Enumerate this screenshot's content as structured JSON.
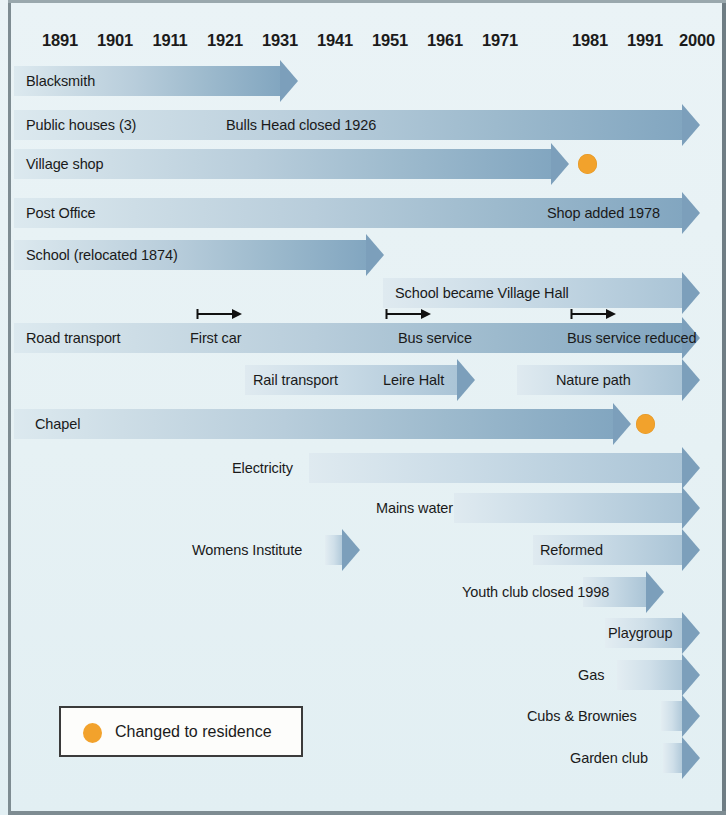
{
  "colors": {
    "background": "#e8f2f5",
    "bar_light": "#dce9ef",
    "bar_dark": "#82a6c0",
    "residence_dot": "#f2a22c",
    "frame": "#7e8c92",
    "text": "#1a1a1a"
  },
  "axis": {
    "label": "Year",
    "years": [
      "1891",
      "1901",
      "1911",
      "1921",
      "1931",
      "1941",
      "1951",
      "1961",
      "1971",
      "1981",
      "1991",
      "2000"
    ],
    "positions": [
      60,
      115,
      170,
      225,
      280,
      335,
      390,
      445,
      500,
      590,
      645,
      697
    ]
  },
  "legend": {
    "marker_name": "orange-dot",
    "text": "Changed to residence"
  },
  "chart_data": {
    "type": "timeline",
    "xlabel": "Year",
    "ylabel": "",
    "xlim": [
      1891,
      2000
    ],
    "grid": false,
    "legend_position": "bottom-left",
    "legend_entries": [
      {
        "marker": "orange-dot",
        "label": "Changed to residence"
      }
    ],
    "rows": [
      {
        "name": "Blacksmith",
        "bars": [
          {
            "label": "Blacksmith",
            "label_align": "left",
            "start_year": 1891,
            "end_year": 1931
          }
        ],
        "markers": [],
        "dots": []
      },
      {
        "name": "Public houses (3)",
        "bars": [
          {
            "label": "Public houses (3)",
            "label_align": "left",
            "start_year": 1891,
            "end_year": 2000
          }
        ],
        "annotations": [
          {
            "text": "Bulls Head closed 1926",
            "year": 1921
          }
        ],
        "markers": [],
        "dots": []
      },
      {
        "name": "Village shop",
        "bars": [
          {
            "label": "Village shop",
            "label_align": "left",
            "start_year": 1891,
            "end_year": 1982
          }
        ],
        "markers": [],
        "dots": [
          {
            "year": 1984,
            "label": "Changed to residence"
          }
        ]
      },
      {
        "name": "Post Office",
        "bars": [
          {
            "label": "Post Office",
            "label_align": "left",
            "start_year": 1891,
            "end_year": 2000
          }
        ],
        "annotations": [
          {
            "text": "Shop added 1978",
            "year": 1978
          }
        ],
        "markers": [],
        "dots": []
      },
      {
        "name": "School (relocated 1874)",
        "bars": [
          {
            "label": "School (relocated 1874)",
            "label_align": "left",
            "start_year": 1891,
            "end_year": 1949
          }
        ],
        "markers": [],
        "dots": []
      },
      {
        "name": "School became Village Hall",
        "bars": [
          {
            "label": "School became Village Hall",
            "label_align": "left",
            "start_year": 1949,
            "end_year": 2000
          }
        ],
        "markers": [],
        "dots": []
      },
      {
        "name": "Road transport",
        "bars": [
          {
            "label": "Road transport",
            "label_align": "left",
            "start_year": 1891,
            "end_year": 2000
          }
        ],
        "annotations": [
          {
            "text": "First car",
            "year": 1918
          },
          {
            "text": "Bus service",
            "year": 1950
          },
          {
            "text": "Bus service reduced",
            "year": 1978
          }
        ],
        "markers": [
          {
            "label": "First car",
            "year": 1915
          },
          {
            "label": "Bus service",
            "year": 1949
          },
          {
            "label": "Bus service reduced",
            "year": 1977
          }
        ],
        "dots": []
      },
      {
        "name": "Rail transport",
        "bars": [
          {
            "label": "Rail transport  Leire Halt",
            "label_align": "left",
            "start_year": 1933,
            "end_year": 1962
          },
          {
            "label": "Nature path",
            "label_align": "left",
            "start_year": 1971,
            "end_year": 2000
          }
        ],
        "markers": [],
        "dots": []
      },
      {
        "name": "Chapel",
        "bars": [
          {
            "label": "Chapel",
            "label_align": "left",
            "start_year": 1891,
            "end_year": 1982
          }
        ],
        "markers": [],
        "dots": [
          {
            "year": 1986,
            "label": "Changed to residence"
          }
        ]
      },
      {
        "name": "Electricity",
        "bars": [
          {
            "label": "Electricity",
            "label_align": "left",
            "start_year": 1937,
            "end_year": 2000
          }
        ],
        "markers": [],
        "dots": []
      },
      {
        "name": "Mains water",
        "bars": [
          {
            "label": "Mains water",
            "label_align": "left",
            "start_year": 1952,
            "end_year": 2000
          }
        ],
        "markers": [],
        "dots": []
      },
      {
        "name": "Womens Institute",
        "bars": [
          {
            "label": "Womens Institute",
            "label_align": "left",
            "start_year": 1924,
            "end_year": 1944
          },
          {
            "label": "Reformed",
            "label_align": "left",
            "start_year": 1965,
            "end_year": 2000
          }
        ],
        "markers": [],
        "dots": []
      },
      {
        "name": "Youth club",
        "bars": [
          {
            "label": "Youth club  closed 1998",
            "label_align": "left",
            "start_year": 1955,
            "end_year": 1993
          }
        ],
        "markers": [],
        "dots": []
      },
      {
        "name": "Playgroup",
        "bars": [
          {
            "label": "Playgroup",
            "label_align": "left",
            "start_year": 1981,
            "end_year": 2000
          }
        ],
        "markers": [],
        "dots": []
      },
      {
        "name": "Gas",
        "bars": [
          {
            "label": "Gas",
            "label_align": "left",
            "start_year": 1983,
            "end_year": 2000
          }
        ],
        "markers": [],
        "dots": []
      },
      {
        "name": "Cubs & Brownies",
        "bars": [
          {
            "label": "Cubs & Brownies",
            "label_align": "left",
            "start_year": 1991,
            "end_year": 2000
          }
        ],
        "markers": [],
        "dots": []
      },
      {
        "name": "Garden club",
        "bars": [
          {
            "label": "Garden club",
            "label_align": "left",
            "start_year": 1993,
            "end_year": 2000
          }
        ],
        "markers": [],
        "dots": []
      }
    ]
  },
  "layout": {
    "rows": [
      {
        "top": 66,
        "bars": [
          {
            "x": 14,
            "w": 284,
            "cls": "",
            "labels": [
              {
                "text": "Blacksmith",
                "x": 26,
                "align": "left"
              }
            ]
          }
        ],
        "markers": [],
        "dots": []
      },
      {
        "top": 110,
        "bars": [
          {
            "x": 14,
            "w": 686,
            "cls": "",
            "labels": [
              {
                "text": "Public houses (3)",
                "x": 26,
                "align": "left"
              },
              {
                "text": "Bulls Head closed 1926",
                "x": 226,
                "align": "left"
              }
            ]
          }
        ],
        "markers": [],
        "dots": []
      },
      {
        "top": 149,
        "bars": [
          {
            "x": 14,
            "w": 555,
            "cls": "",
            "labels": [
              {
                "text": "Village shop",
                "x": 26,
                "align": "left"
              }
            ]
          }
        ],
        "markers": [],
        "dots": [
          {
            "x": 578,
            "y": 5
          }
        ]
      },
      {
        "top": 198,
        "bars": [
          {
            "x": 14,
            "w": 686,
            "cls": "",
            "labels": [
              {
                "text": "Post Office",
                "x": 26,
                "align": "left"
              },
              {
                "text": "Shop added 1978",
                "x": 660,
                "align": "right"
              }
            ]
          }
        ],
        "markers": [],
        "dots": []
      },
      {
        "top": 240,
        "bars": [
          {
            "x": 14,
            "w": 370,
            "cls": "",
            "labels": [
              {
                "text": "School (relocated 1874)",
                "x": 26,
                "align": "left"
              }
            ]
          }
        ],
        "markers": [],
        "dots": []
      },
      {
        "top": 278,
        "bars": [
          {
            "x": 383,
            "w": 317,
            "cls": "short",
            "labels": [
              {
                "text": "School became Village Hall",
                "x": 395,
                "align": "left"
              }
            ]
          }
        ],
        "markers": [],
        "dots": []
      },
      {
        "top": 323,
        "bars": [
          {
            "x": 14,
            "w": 686,
            "cls": "",
            "labels": [
              {
                "text": "Road transport",
                "x": 26,
                "align": "left"
              },
              {
                "text": "First car",
                "x": 190,
                "align": "left"
              },
              {
                "text": "Bus service",
                "x": 398,
                "align": "left"
              },
              {
                "text": "Bus service reduced",
                "x": 567,
                "align": "left"
              }
            ]
          }
        ],
        "markers": [
          {
            "x": 196,
            "y": -16,
            "w": 46
          },
          {
            "x": 385,
            "y": -16,
            "w": 46
          },
          {
            "x": 570,
            "y": -16,
            "w": 46
          }
        ],
        "dots": []
      },
      {
        "top": 365,
        "bars": [
          {
            "x": 245,
            "w": 230,
            "cls": "short",
            "labels": [
              {
                "text": "Rail transport",
                "x": 253,
                "align": "left"
              },
              {
                "text": "Leire Halt",
                "x": 383,
                "align": "left"
              }
            ]
          },
          {
            "x": 517,
            "w": 183,
            "cls": "short",
            "labels": [
              {
                "text": "Nature path",
                "x": 556,
                "align": "left"
              }
            ]
          }
        ],
        "markers": [],
        "dots": []
      },
      {
        "top": 409,
        "bars": [
          {
            "x": 14,
            "w": 617,
            "cls": "",
            "labels": [
              {
                "text": "Chapel",
                "x": 35,
                "align": "left"
              }
            ]
          }
        ],
        "markers": [],
        "dots": [
          {
            "x": 636,
            "y": 5
          }
        ]
      },
      {
        "top": 453,
        "bars": [
          {
            "x": 309,
            "w": 391,
            "cls": "short",
            "labels": [
              {
                "text": "Electricity",
                "x": 232,
                "align": "left"
              }
            ]
          }
        ],
        "markers": [],
        "dots": []
      },
      {
        "top": 493,
        "bars": [
          {
            "x": 454,
            "w": 246,
            "cls": "short",
            "labels": [
              {
                "text": "Mains water",
                "x": 376,
                "align": "left"
              }
            ]
          }
        ],
        "markers": [],
        "dots": []
      },
      {
        "top": 535,
        "bars": [
          {
            "x": 325,
            "w": 35,
            "cls": "vshort",
            "labels": [
              {
                "text": "Womens Institute",
                "x": 192,
                "align": "left"
              }
            ]
          },
          {
            "x": 533,
            "w": 167,
            "cls": "short",
            "labels": [
              {
                "text": "Reformed",
                "x": 540,
                "align": "left"
              }
            ]
          }
        ],
        "markers": [],
        "dots": []
      },
      {
        "top": 577,
        "bars": [
          {
            "x": 583,
            "w": 81,
            "cls": "short",
            "labels": [
              {
                "text": "Youth club  closed 1998",
                "x": 462,
                "align": "left"
              }
            ]
          }
        ],
        "markers": [],
        "dots": []
      },
      {
        "top": 618,
        "bars": [
          {
            "x": 605,
            "w": 95,
            "cls": "vshort",
            "labels": [
              {
                "text": "Playgroup",
                "x": 608,
                "align": "left"
              }
            ]
          }
        ],
        "markers": [],
        "dots": []
      },
      {
        "top": 660,
        "bars": [
          {
            "x": 617,
            "w": 83,
            "cls": "vshort",
            "labels": [
              {
                "text": "Gas",
                "x": 578,
                "align": "left"
              }
            ]
          }
        ],
        "markers": [],
        "dots": []
      },
      {
        "top": 701,
        "bars": [
          {
            "x": 661,
            "w": 39,
            "cls": "vshort",
            "labels": [
              {
                "text": "Cubs & Brownies",
                "x": 527,
                "align": "left"
              }
            ]
          }
        ],
        "markers": [],
        "dots": []
      },
      {
        "top": 743,
        "bars": [
          {
            "x": 663,
            "w": 37,
            "cls": "vshort",
            "labels": [
              {
                "text": "Garden club",
                "x": 570,
                "align": "left"
              }
            ]
          }
        ],
        "markers": [],
        "dots": []
      }
    ]
  }
}
